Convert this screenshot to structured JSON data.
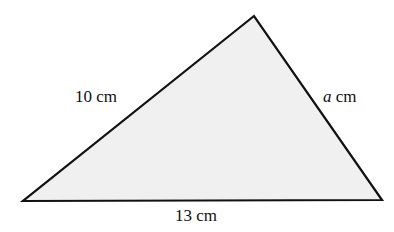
{
  "diagram": {
    "type": "triangle",
    "fill_color": "#f0f0f0",
    "stroke_color": "#111111",
    "vertices": {
      "top": [
        254,
        16
      ],
      "bottom_left": [
        23,
        201
      ],
      "bottom_right": [
        382,
        200
      ]
    },
    "sides": {
      "left": {
        "value": "10",
        "unit": "cm"
      },
      "right": {
        "variable": "a",
        "unit": "cm"
      },
      "bottom": {
        "value": "13",
        "unit": "cm"
      }
    }
  }
}
